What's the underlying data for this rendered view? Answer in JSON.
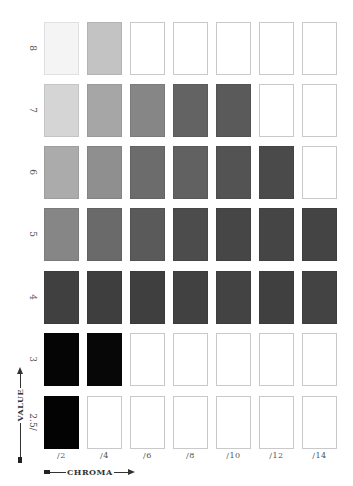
{
  "chart_data": {
    "type": "heatmap",
    "title": "",
    "xlabel": "CHROMA",
    "ylabel": "VALUE",
    "x_categories": [
      "/2",
      "/4",
      "/6",
      "/8",
      "/10",
      "/12",
      "/14"
    ],
    "y_categories": [
      "8",
      "7",
      "6",
      "5",
      "4",
      "3",
      "2.5/"
    ],
    "cells_description": "Grayscale chips; null = empty outlined slot (no chip)",
    "rows": [
      {
        "value": "8",
        "colors": [
          "#f4f4f4",
          "#c3c3c3",
          null,
          null,
          null,
          null,
          null
        ]
      },
      {
        "value": "7",
        "colors": [
          "#d5d5d5",
          "#a6a6a6",
          "#868686",
          "#636363",
          "#5a5a5a",
          null,
          null
        ]
      },
      {
        "value": "6",
        "colors": [
          "#ababab",
          "#8f8f8f",
          "#6c6c6c",
          "#616161",
          "#535353",
          "#4a4a4a",
          null
        ]
      },
      {
        "value": "5",
        "colors": [
          "#868686",
          "#6a6a6a",
          "#5a5a5a",
          "#4c4c4c",
          "#464646",
          "#454545",
          "#444444"
        ]
      },
      {
        "value": "4",
        "colors": [
          "#404040",
          "#3e3e3e",
          "#3f3f3f",
          "#414141",
          "#434343",
          "#404040",
          "#434343"
        ]
      },
      {
        "value": "3",
        "colors": [
          "#050505",
          "#070707",
          null,
          null,
          null,
          null,
          null
        ]
      },
      {
        "value": "2.5/",
        "colors": [
          "#030303",
          null,
          null,
          null,
          null,
          null,
          null
        ]
      }
    ],
    "legend": [],
    "grid": false
  },
  "layout": {
    "col_x": [
      44,
      87,
      130,
      173,
      216,
      259,
      302
    ],
    "row_y": [
      22,
      84,
      146,
      208,
      271,
      333,
      396
    ]
  },
  "axis": {
    "chroma_title": "CHROMA",
    "value_title": "VALUE"
  }
}
